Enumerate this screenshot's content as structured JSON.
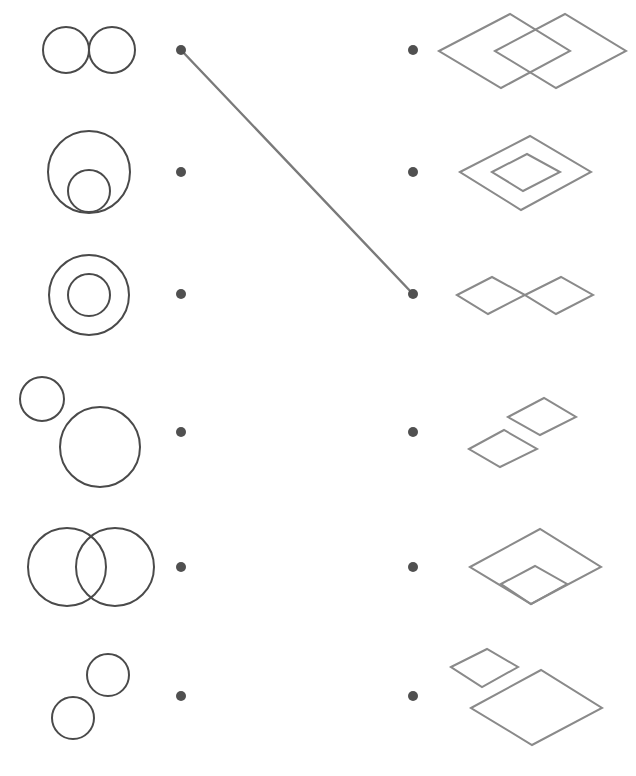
{
  "worksheet": {
    "task": "match circle figures to rhombus figures",
    "colors": {
      "circle_stroke": "#4a4a4a",
      "rhombus_stroke": "#8a8a8a",
      "dot": "#505050",
      "link": "#7a7a7a"
    },
    "left_dots": [
      [
        181,
        50
      ],
      [
        181,
        172
      ],
      [
        181,
        294
      ],
      [
        181,
        432
      ],
      [
        181,
        567
      ],
      [
        181,
        696
      ]
    ],
    "right_dots": [
      [
        413,
        50
      ],
      [
        413,
        172
      ],
      [
        413,
        294
      ],
      [
        413,
        432
      ],
      [
        413,
        567
      ],
      [
        413,
        696
      ]
    ],
    "connections": [
      {
        "from_left": 0,
        "to_right": 2
      }
    ],
    "left_figures": [
      {
        "name": "two-tangent-circles",
        "circles": [
          [
            66,
            50,
            23
          ],
          [
            112,
            50,
            23
          ]
        ]
      },
      {
        "name": "internally-tangent-circles",
        "circles": [
          [
            89,
            172,
            41
          ],
          [
            89,
            191,
            21
          ]
        ]
      },
      {
        "name": "concentric-circles",
        "circles": [
          [
            89,
            295,
            40
          ],
          [
            89,
            295,
            21
          ]
        ]
      },
      {
        "name": "separate-circles-small-large",
        "circles": [
          [
            42,
            399,
            22
          ],
          [
            100,
            447,
            40
          ]
        ]
      },
      {
        "name": "overlapping-circles",
        "circles": [
          [
            67,
            567,
            39
          ],
          [
            115,
            567,
            39
          ]
        ]
      },
      {
        "name": "separate-circles-equal",
        "circles": [
          [
            108,
            675,
            21
          ],
          [
            73,
            718,
            21
          ]
        ]
      }
    ],
    "right_figures": [
      {
        "name": "overlapping-rhombuses",
        "polygons": [
          [
            [
              439,
              51
            ],
            [
              510,
              14
            ],
            [
              570,
              51
            ],
            [
              501,
              88
            ]
          ],
          [
            [
              495,
              51
            ],
            [
              565,
              14
            ],
            [
              626,
              51
            ],
            [
              556,
              88
            ]
          ]
        ]
      },
      {
        "name": "nested-rhombuses",
        "polygons": [
          [
            [
              460,
              172
            ],
            [
              530,
              136
            ],
            [
              591,
              172
            ],
            [
              521,
              210
            ]
          ],
          [
            [
              492,
              172
            ],
            [
              527,
              154
            ],
            [
              560,
              172
            ],
            [
              523,
              191
            ]
          ]
        ]
      },
      {
        "name": "vertex-touching-rhombuses",
        "polygons": [
          [
            [
              457,
              295
            ],
            [
              492,
              277
            ],
            [
              525,
              295
            ],
            [
              488,
              314
            ]
          ],
          [
            [
              525,
              295
            ],
            [
              561,
              277
            ],
            [
              593,
              295
            ],
            [
              556,
              314
            ]
          ]
        ]
      },
      {
        "name": "separate-rhombuses",
        "polygons": [
          [
            [
              469,
              449
            ],
            [
              504,
              430
            ],
            [
              537,
              449
            ],
            [
              500,
              467
            ]
          ],
          [
            [
              508,
              417
            ],
            [
              544,
              398
            ],
            [
              576,
              417
            ],
            [
              540,
              435
            ]
          ]
        ]
      },
      {
        "name": "corner-nested-rhombuses",
        "polygons": [
          [
            [
              470,
              567
            ],
            [
              540,
              529
            ],
            [
              601,
              567
            ],
            [
              531,
              604
            ]
          ],
          [
            [
              501,
              584
            ],
            [
              535,
              566
            ],
            [
              567,
              584
            ],
            [
              531,
              604
            ]
          ]
        ]
      },
      {
        "name": "separate-rhombuses-small-large",
        "polygons": [
          [
            [
              451,
              667
            ],
            [
              487,
              649
            ],
            [
              518,
              667
            ],
            [
              482,
              687
            ]
          ],
          [
            [
              471,
              708
            ],
            [
              541,
              670
            ],
            [
              602,
              708
            ],
            [
              532,
              745
            ]
          ]
        ]
      }
    ]
  }
}
